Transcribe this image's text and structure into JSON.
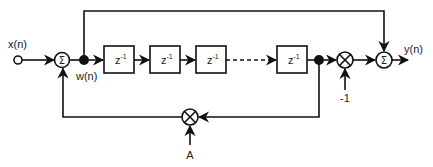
{
  "diagram": {
    "title": "",
    "type": "signal-flow block diagram",
    "input_label": "x(n)",
    "output_label": "y(n)",
    "internal_signal_label": "w(n)",
    "sum_symbol": "Σ",
    "delay_block": {
      "base": "z",
      "exponent": "-1"
    },
    "delay_blocks_count": 4,
    "feedback_gain_label": "A",
    "output_gain_label": "-1",
    "colors": {
      "line": "#111111",
      "background": "#ffffff"
    }
  },
  "nodes": [
    {
      "id": "input",
      "kind": "source",
      "label": "x(n)"
    },
    {
      "id": "sum1",
      "kind": "adder",
      "symbol": "Σ"
    },
    {
      "id": "w",
      "kind": "branch-point",
      "label": "w(n)"
    },
    {
      "id": "d1",
      "kind": "delay",
      "label": "z^-1"
    },
    {
      "id": "d2",
      "kind": "delay",
      "label": "z^-1"
    },
    {
      "id": "d3",
      "kind": "delay",
      "label": "z^-1"
    },
    {
      "id": "dN",
      "kind": "delay",
      "label": "z^-1"
    },
    {
      "id": "tap",
      "kind": "branch-point"
    },
    {
      "id": "mul_out",
      "kind": "multiplier",
      "gain": "-1"
    },
    {
      "id": "sum2",
      "kind": "adder",
      "symbol": "Σ"
    },
    {
      "id": "mul_fb",
      "kind": "multiplier",
      "gain": "A"
    },
    {
      "id": "output",
      "kind": "sink",
      "label": "y(n)"
    }
  ],
  "edges": [
    [
      "input",
      "sum1"
    ],
    [
      "sum1",
      "w"
    ],
    [
      "w",
      "d1"
    ],
    [
      "d1",
      "d2"
    ],
    [
      "d2",
      "d3"
    ],
    [
      "d3",
      "dN",
      "dashed"
    ],
    [
      "dN",
      "tap"
    ],
    [
      "tap",
      "mul_out"
    ],
    [
      "mul_out",
      "sum2"
    ],
    [
      "w",
      "sum2",
      "feedforward"
    ],
    [
      "tap",
      "mul_fb"
    ],
    [
      "mul_fb",
      "sum1"
    ],
    [
      "sum2",
      "output"
    ]
  ]
}
